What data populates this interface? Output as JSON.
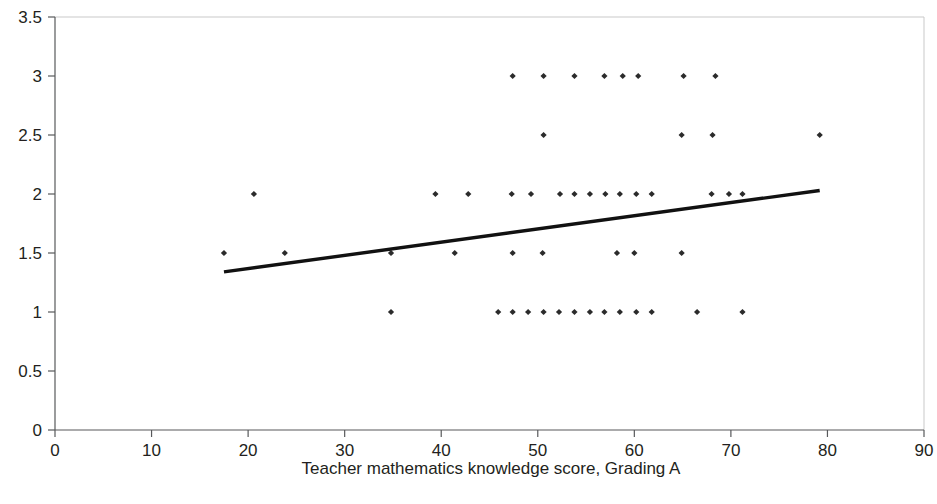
{
  "chart_data": {
    "type": "scatter",
    "title": "",
    "xlabel": "Teacher mathematics knowledge score, Grading A",
    "ylabel": "",
    "xlim": [
      0,
      90
    ],
    "ylim": [
      0,
      3.5
    ],
    "xticks": [
      0,
      10,
      20,
      30,
      40,
      50,
      60,
      70,
      80,
      90
    ],
    "yticks": [
      0,
      0.5,
      1,
      1.5,
      2,
      2.5,
      3,
      3.5
    ],
    "xtick_labels": [
      "0",
      "10",
      "20",
      "30",
      "40",
      "50",
      "60",
      "70",
      "80",
      "90"
    ],
    "ytick_labels": [
      "0",
      "0.5",
      "1",
      "1.5",
      "2",
      "2.5",
      "3",
      "3.5"
    ],
    "grid": false,
    "legend": null,
    "marker": "small-diamond",
    "marker_color": "#2b2b2b",
    "series": [
      {
        "name": "observations",
        "points": [
          [
            17.5,
            1.5
          ],
          [
            20.6,
            2.0
          ],
          [
            23.8,
            1.5
          ],
          [
            34.8,
            1.0
          ],
          [
            34.8,
            1.5
          ],
          [
            39.4,
            2.0
          ],
          [
            41.4,
            1.5
          ],
          [
            42.8,
            2.0
          ],
          [
            45.9,
            1.0
          ],
          [
            47.4,
            1.0
          ],
          [
            47.4,
            1.5
          ],
          [
            47.3,
            2.0
          ],
          [
            47.4,
            3.0
          ],
          [
            49.0,
            1.0
          ],
          [
            49.3,
            2.0
          ],
          [
            50.6,
            1.0
          ],
          [
            50.5,
            1.5
          ],
          [
            50.6,
            2.5
          ],
          [
            50.6,
            3.0
          ],
          [
            52.2,
            1.0
          ],
          [
            52.3,
            2.0
          ],
          [
            53.8,
            1.0
          ],
          [
            53.8,
            2.0
          ],
          [
            53.8,
            3.0
          ],
          [
            55.4,
            1.0
          ],
          [
            55.4,
            2.0
          ],
          [
            56.9,
            1.0
          ],
          [
            57.0,
            2.0
          ],
          [
            56.9,
            3.0
          ],
          [
            58.5,
            1.0
          ],
          [
            58.2,
            1.5
          ],
          [
            58.5,
            2.0
          ],
          [
            58.8,
            3.0
          ],
          [
            60.2,
            1.0
          ],
          [
            60.0,
            1.5
          ],
          [
            60.2,
            2.0
          ],
          [
            60.4,
            3.0
          ],
          [
            61.8,
            1.0
          ],
          [
            61.8,
            2.0
          ],
          [
            64.9,
            1.5
          ],
          [
            64.9,
            2.5
          ],
          [
            65.1,
            3.0
          ],
          [
            66.5,
            1.0
          ],
          [
            68.0,
            2.0
          ],
          [
            68.1,
            2.5
          ],
          [
            68.4,
            3.0
          ],
          [
            69.8,
            2.0
          ],
          [
            71.2,
            1.0
          ],
          [
            71.2,
            2.0
          ],
          [
            79.2,
            2.5
          ]
        ]
      }
    ],
    "trendline": {
      "name": "linear-fit",
      "x_start": 17.5,
      "y_start": 1.34,
      "x_end": 79.2,
      "y_end": 2.03,
      "color": "#111111"
    }
  },
  "labels": {
    "x_axis_title": "Teacher mathematics knowledge score, Grading A"
  }
}
